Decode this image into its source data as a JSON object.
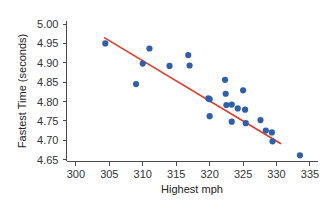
{
  "chart_data": {
    "type": "scatter",
    "title": "",
    "subtitle": "",
    "xlabel": "Highest mph",
    "ylabel": "Fastest Time (seconds)",
    "xlim": [
      298.6,
      336.2
    ],
    "ylim": [
      4.645,
      5.008
    ],
    "xticks": [
      300,
      305,
      310,
      315,
      320,
      325,
      330,
      335
    ],
    "xtick_labels": [
      "300",
      "305",
      "310",
      "315",
      "320",
      "325",
      "330",
      "335"
    ],
    "yticks": [
      4.65,
      4.7,
      4.75,
      4.8,
      4.85,
      4.9,
      4.95,
      5.0
    ],
    "ytick_labels": [
      "4.65",
      "4.70",
      "4.75",
      "4.80",
      "4.85",
      "4.90",
      "4.95",
      "5.00"
    ],
    "grid": false,
    "legend": null,
    "legend_position": "none",
    "point_color": "#2f5fa8",
    "line_color": "#e03a28",
    "marker_size": 3.1,
    "points": [
      {
        "x": 304.4,
        "y": 4.95
      },
      {
        "x": 309.0,
        "y": 4.845
      },
      {
        "x": 310.0,
        "y": 4.898
      },
      {
        "x": 311.0,
        "y": 4.937
      },
      {
        "x": 314.0,
        "y": 4.892
      },
      {
        "x": 316.8,
        "y": 4.92
      },
      {
        "x": 317.0,
        "y": 4.893
      },
      {
        "x": 319.8,
        "y": 4.808
      },
      {
        "x": 320.0,
        "y": 4.806
      },
      {
        "x": 320.0,
        "y": 4.762
      },
      {
        "x": 322.3,
        "y": 4.856
      },
      {
        "x": 322.4,
        "y": 4.82
      },
      {
        "x": 322.5,
        "y": 4.791
      },
      {
        "x": 323.3,
        "y": 4.792
      },
      {
        "x": 323.3,
        "y": 4.748
      },
      {
        "x": 324.2,
        "y": 4.782
      },
      {
        "x": 325.0,
        "y": 4.829
      },
      {
        "x": 325.3,
        "y": 4.779
      },
      {
        "x": 325.4,
        "y": 4.744
      },
      {
        "x": 327.6,
        "y": 4.752
      },
      {
        "x": 328.4,
        "y": 4.725
      },
      {
        "x": 329.3,
        "y": 4.72
      },
      {
        "x": 329.4,
        "y": 4.697
      },
      {
        "x": 333.5,
        "y": 4.661
      }
    ],
    "fit_line": {
      "label": "regression-line",
      "x_start": 304.3,
      "y_start": 4.9645,
      "x_end": 330.6,
      "y_end": 4.6915
    }
  }
}
